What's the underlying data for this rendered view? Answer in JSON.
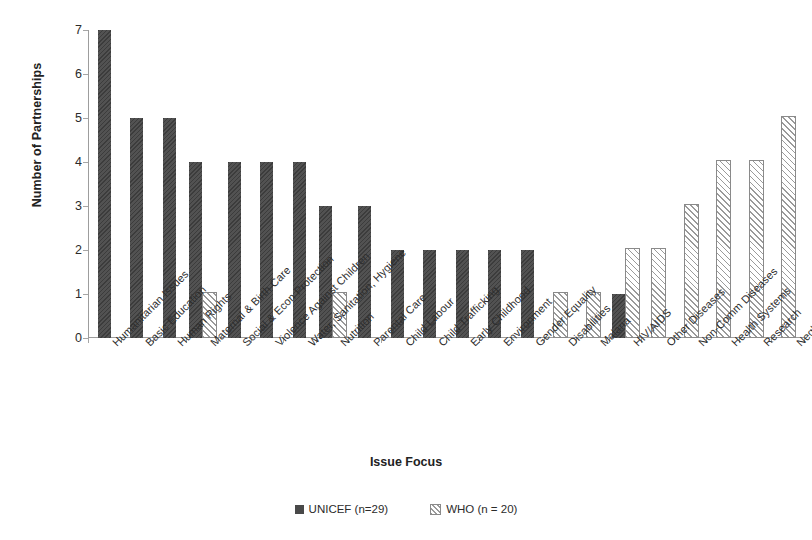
{
  "chart_data": {
    "type": "bar",
    "title": "",
    "xlabel": "Issue Focus",
    "ylabel": "Number of Partnerships",
    "ylim": [
      0,
      7
    ],
    "ytick_labels": [
      "0",
      "1",
      "2",
      "3",
      "4",
      "5",
      "6",
      "7"
    ],
    "grid": false,
    "legend_position": "bottom-center",
    "categories": [
      "Humanitarian Issues",
      "Basic Education",
      "Human Rights",
      "Maternal & Birth Care",
      "Social & Econ Protection",
      "Violence Against Children",
      "Water, Sanitation, Hygiene",
      "Nutrition",
      "Parental Care",
      "Child Labour",
      "Child Trafficking",
      "Early Childhood",
      "Environment",
      "Gender Equality",
      "Disabilities",
      "Malaria",
      "HIV/AIDS",
      "Other Diseases",
      "Non-Comm Diseases",
      "Health Systems",
      "Research",
      "Neglected & Tropical Diseases"
    ],
    "series": [
      {
        "name": "UNICEF (n=29)",
        "key": "unicef",
        "color": "#494949",
        "pattern": "solid",
        "values": [
          7,
          5,
          5,
          4,
          4,
          4,
          4,
          3,
          3,
          2,
          2,
          2,
          2,
          2,
          0,
          0,
          1,
          0,
          0,
          0,
          0,
          0
        ]
      },
      {
        "name": "WHO (n = 20)",
        "key": "who",
        "color": "#ffffff",
        "pattern": "diagonal-hatch",
        "values": [
          0,
          0,
          0,
          1,
          0,
          0,
          0,
          1,
          0,
          0,
          0,
          0,
          0,
          0,
          1,
          1,
          2,
          2,
          3,
          4,
          4,
          5
        ]
      }
    ]
  },
  "legend": {
    "items": [
      {
        "label": "UNICEF (n=29)",
        "swatch": "unicef"
      },
      {
        "label": "WHO (n = 20)",
        "swatch": "who"
      }
    ]
  }
}
